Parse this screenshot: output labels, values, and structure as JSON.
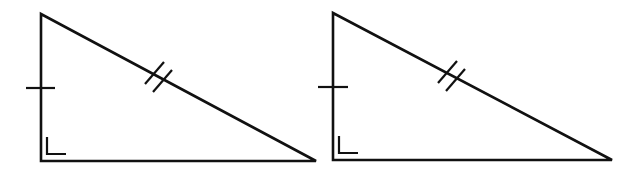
{
  "diagram": {
    "stroke_color": "#111111",
    "background": "#ffffff",
    "triangles": [
      {
        "id": "left",
        "vertices": {
          "top": [
            41,
            14
          ],
          "right_angle": [
            41,
            161
          ],
          "acute": [
            316,
            161
          ]
        },
        "leg_tick": {
          "count": 1,
          "side": "vertical-leg",
          "x1": 26,
          "y1": 88,
          "x2": 55,
          "y2": 88
        },
        "hypotenuse_ticks": {
          "count": 2,
          "lines": [
            [
              145,
              84,
              164,
              62
            ],
            [
              153,
              92,
              172,
              70
            ]
          ]
        },
        "right_angle_mark": [
          [
            47,
            137
          ],
          [
            47,
            154
          ],
          [
            66,
            154
          ]
        ]
      },
      {
        "id": "right",
        "vertices": {
          "top": [
            333,
            13
          ],
          "right_angle": [
            333,
            160
          ],
          "acute": [
            612,
            160
          ]
        },
        "leg_tick": {
          "count": 1,
          "side": "vertical-leg",
          "x1": 318,
          "y1": 87,
          "x2": 348,
          "y2": 87
        },
        "hypotenuse_ticks": {
          "count": 2,
          "lines": [
            [
              438,
              83,
              457,
              61
            ],
            [
              446,
              91,
              465,
              69
            ]
          ]
        },
        "right_angle_mark": [
          [
            339,
            136
          ],
          [
            339,
            153
          ],
          [
            358,
            153
          ]
        ]
      }
    ]
  }
}
